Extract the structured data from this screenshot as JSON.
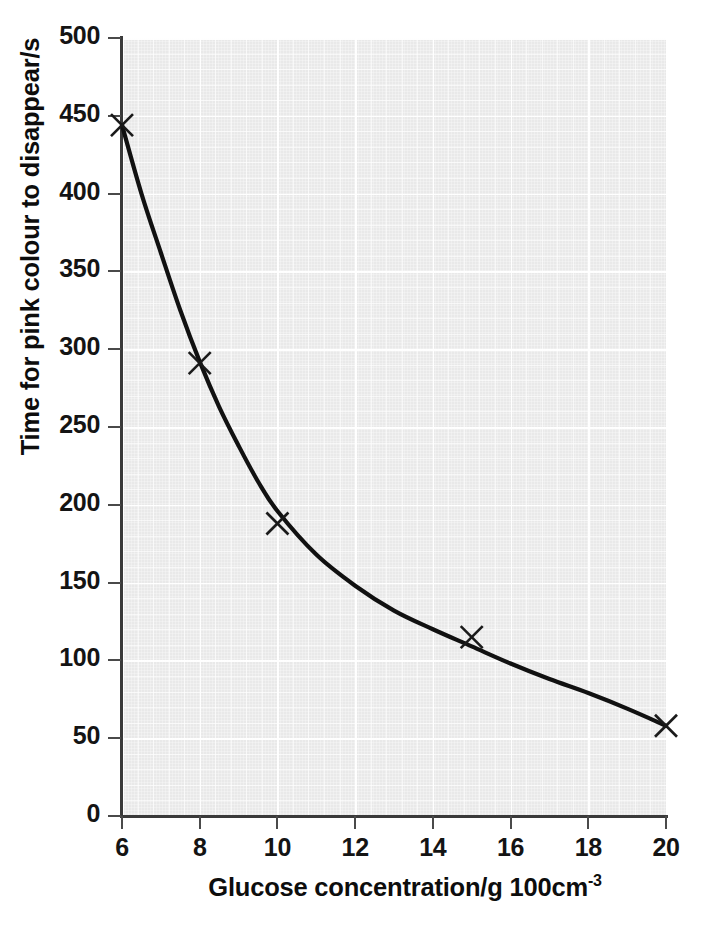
{
  "chart_data": {
    "type": "scatter",
    "title": "",
    "subtitle": "",
    "xlabel": "Glucose concentration/g 100cm",
    "xlabel_superscript": "-3",
    "xlabel_full": "Glucose concentration/g 100cm⁻³",
    "ylabel": "Time for pink colour to disappear/s",
    "xlim": [
      6,
      20
    ],
    "ylim": [
      0,
      500
    ],
    "xticks": [
      6,
      8,
      10,
      12,
      14,
      16,
      18,
      20
    ],
    "yticks": [
      0,
      50,
      100,
      150,
      200,
      250,
      300,
      350,
      400,
      450,
      500
    ],
    "xtick_labels": [
      "6",
      "8",
      "10",
      "12",
      "14",
      "16",
      "18",
      "20"
    ],
    "ytick_labels": [
      "0",
      "50",
      "100",
      "150",
      "200",
      "250",
      "300",
      "350",
      "400",
      "450",
      "500"
    ],
    "x_minor_step": 0.4,
    "y_minor_step": 10,
    "grid": true,
    "grid_style": "graph-paper",
    "legend": false,
    "legend_position": "none",
    "marker": "x-cross",
    "marker_color": "#1a1a1a",
    "curve_color": "#111111",
    "curve_width": 4,
    "plot_background": "#e9e9e9",
    "gridline_color": "#ffffff",
    "axis_color": "#3a3a3a",
    "series": [
      {
        "name": "Time for pink colour to disappear",
        "x": [
          6,
          8,
          10,
          15,
          20
        ],
        "y": [
          444,
          291,
          188,
          115,
          58
        ],
        "has_fitted_curve": true,
        "fitted_curve_description": "smooth decreasing curve of best fit through the plotted crosses"
      }
    ],
    "fitted_curve_points": {
      "x": [
        6,
        6.5,
        7,
        7.5,
        8,
        8.5,
        9,
        9.5,
        10,
        11,
        12,
        13,
        14,
        15,
        16,
        17,
        18,
        19,
        20
      ],
      "y": [
        444,
        400,
        362,
        325,
        292,
        263,
        238,
        215,
        196,
        168,
        148,
        132,
        120,
        109,
        98,
        88,
        79,
        69,
        58
      ]
    },
    "annotations": []
  },
  "figure": {
    "marker_points": [
      {
        "label": "point-1",
        "x": 6,
        "y": 444
      },
      {
        "label": "point-2",
        "x": 8,
        "y": 291
      },
      {
        "label": "point-3",
        "x": 10,
        "y": 188
      },
      {
        "label": "point-4",
        "x": 15,
        "y": 115
      },
      {
        "label": "point-5",
        "x": 20,
        "y": 58
      }
    ]
  }
}
